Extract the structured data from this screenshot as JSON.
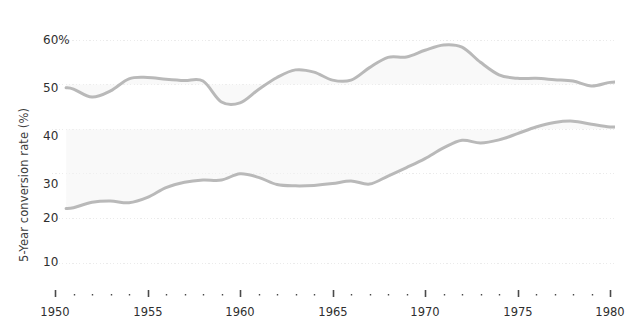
{
  "chart_data": {
    "type": "line",
    "title": "",
    "subtitle": "",
    "xlabel": "",
    "ylabel": "5-Year conversion rate (%)",
    "xlim": [
      1950,
      1980.8
    ],
    "ylim": [
      5,
      64
    ],
    "grid": true,
    "grid_axis": "y",
    "legend": "none",
    "line_color": "#b9b9b9",
    "area_fill_color": "#f4f4f4",
    "gridline_color": "#ebebeb",
    "axis_text_color": "#2f2f2f",
    "y_ticks": [
      10,
      20,
      30,
      40,
      50,
      60
    ],
    "y_tick_labels": [
      "10",
      "20",
      "30",
      "40",
      "50",
      "60%"
    ],
    "x_ticks_major": [
      1950,
      1955,
      1960,
      1965,
      1970,
      1975,
      1980
    ],
    "x_tick_labels": [
      "1950",
      "1955",
      "1960",
      "1965",
      "1970",
      "1975",
      "1980"
    ],
    "x_minor_tick_step": 1,
    "series": [
      {
        "name": "upper-series",
        "x": [
          1950.6,
          1951,
          1952,
          1953,
          1954,
          1955,
          1956,
          1957,
          1958,
          1959,
          1960,
          1961,
          1962,
          1963,
          1964,
          1965,
          1966,
          1967,
          1968,
          1969,
          1970,
          1971,
          1972,
          1973,
          1974,
          1975,
          1976,
          1977,
          1978,
          1979,
          1980,
          1980.8
        ],
        "values": [
          49.3,
          49.0,
          47.2,
          48.6,
          51.3,
          51.6,
          51.2,
          50.9,
          50.8,
          46.1,
          45.9,
          48.9,
          51.6,
          53.3,
          52.8,
          51.0,
          51.0,
          53.8,
          56.1,
          56.2,
          57.7,
          58.9,
          58.4,
          55.0,
          52.2,
          51.4,
          51.4,
          51.1,
          50.8,
          49.7,
          50.5,
          50.6
        ]
      },
      {
        "name": "lower-series",
        "x": [
          1950.6,
          1951,
          1952,
          1953,
          1954,
          1955,
          1956,
          1957,
          1958,
          1959,
          1960,
          1961,
          1962,
          1963,
          1964,
          1965,
          1966,
          1967,
          1968,
          1969,
          1970,
          1971,
          1972,
          1973,
          1974,
          1975,
          1976,
          1977,
          1978,
          1979,
          1980,
          1980.8
        ],
        "values": [
          22.2,
          22.4,
          23.6,
          23.9,
          23.5,
          24.7,
          26.9,
          28.1,
          28.6,
          28.6,
          30.0,
          29.2,
          27.6,
          27.3,
          27.4,
          27.8,
          28.4,
          27.7,
          29.5,
          31.4,
          33.4,
          35.8,
          37.5,
          36.9,
          37.6,
          39.0,
          40.5,
          41.5,
          41.8,
          41.1,
          40.5,
          40.6
        ]
      }
    ],
    "annotations": []
  },
  "axis": {
    "y_title": "5-Year conversion rate (%)"
  }
}
